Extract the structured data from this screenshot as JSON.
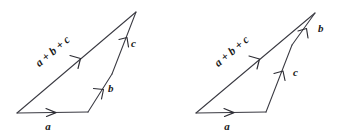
{
  "figure": {
    "background_color": "#ffffff",
    "line_color": "#3a3a42",
    "text_color": "#1a1a1a",
    "diagrams": [
      {
        "id": "left-diagram",
        "name": "vector-triangle-left",
        "labels": {
          "vector_a": "a",
          "vector_b": "b",
          "vector_c": "c",
          "resultant": "a + b + c"
        },
        "geometry": {
          "origin": [
            17,
            113
          ],
          "a_end": [
            88,
            112
          ],
          "b_end": [
            112,
            74
          ],
          "apex": [
            136,
            12
          ]
        },
        "order": [
          "a",
          "b",
          "c"
        ]
      },
      {
        "id": "right-diagram",
        "name": "vector-triangle-right",
        "labels": {
          "vector_a": "a",
          "vector_b": "b",
          "vector_c": "c",
          "resultant": "a + b + c"
        },
        "geometry": {
          "origin": [
            196,
            113
          ],
          "a_end": [
            266,
            112
          ],
          "c_end": [
            292,
            45
          ],
          "apex": [
            315,
            13
          ]
        },
        "order": [
          "a",
          "c",
          "b"
        ]
      }
    ]
  }
}
